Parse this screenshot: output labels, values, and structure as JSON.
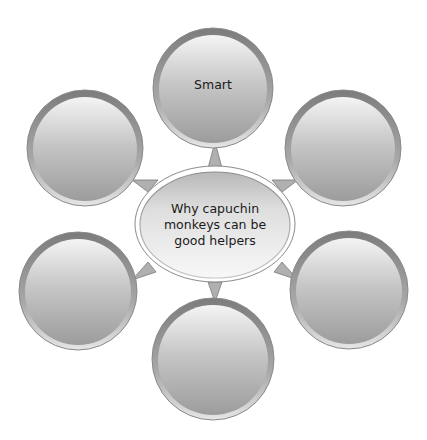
{
  "diagram": {
    "type": "bubble-map",
    "colors": {
      "background": "#ffffff",
      "bubble_light": "#f2f2f2",
      "bubble_mid": "#c4c4c4",
      "bubble_dark": "#9a9a9a",
      "rim": "#7a7a7a",
      "text": "#1a1a1a"
    },
    "center": {
      "label": "Why capuchin monkeys can be good helpers",
      "lines": [
        "Why capuchin",
        "monkeys can be",
        "good helpers"
      ]
    },
    "bubbles": [
      {
        "position": "top",
        "label": "Smart"
      },
      {
        "position": "upper-right",
        "label": ""
      },
      {
        "position": "lower-right",
        "label": ""
      },
      {
        "position": "bottom",
        "label": ""
      },
      {
        "position": "lower-left",
        "label": ""
      },
      {
        "position": "upper-left",
        "label": ""
      }
    ]
  }
}
